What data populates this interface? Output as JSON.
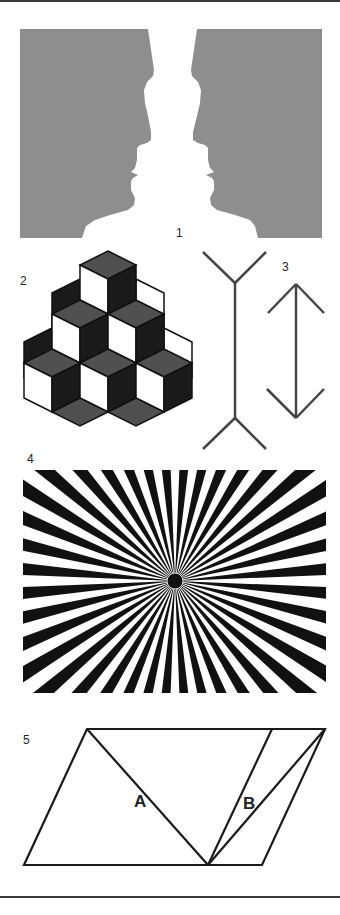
{
  "page": {
    "figures": [
      {
        "number": "1",
        "name": "Rubin vase / faces",
        "face_color": "#8e8e8e"
      },
      {
        "number": "2",
        "name": "Reversible stacked cubes",
        "colors": {
          "top": "#505050",
          "dark_side": "#1a1a1a",
          "light_side": "#ffffff",
          "outline": "#111111"
        }
      },
      {
        "number": "3",
        "name": "Müller-Lyer illusion",
        "line_color": "#444444"
      },
      {
        "number": "4",
        "name": "Hering sunburst illusion",
        "ray_count": 40,
        "ray_color": "#111111"
      },
      {
        "number": "5",
        "name": "Sander parallelogram",
        "labels": [
          "A",
          "B"
        ],
        "line_color": "#1a1a1a"
      }
    ]
  },
  "labels": {
    "fig1": "1",
    "fig2": "2",
    "fig3": "3",
    "fig4": "4",
    "fig5": "5",
    "segA": "A",
    "segB": "B"
  }
}
